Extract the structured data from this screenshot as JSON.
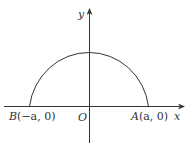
{
  "diagram": {
    "type": "semicircle-on-axes",
    "colors": {
      "stroke": "#333333",
      "background": "#ffffff"
    },
    "axes": {
      "x_label": "x",
      "y_label": "y",
      "origin_label": "O"
    },
    "points": {
      "A": {
        "name": "A",
        "coords": "(a, 0)"
      },
      "B": {
        "name": "B",
        "coords": "(−a, 0)"
      }
    },
    "curve": "upper semicircle centered at O with radius a"
  }
}
